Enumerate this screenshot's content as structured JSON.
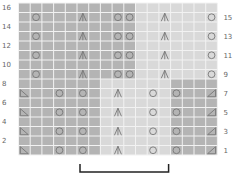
{
  "chart_data": {
    "type": "knitting-chart",
    "columns": 17,
    "rows": 16,
    "left_row_labels": [
      "2",
      "4",
      "6",
      "8",
      "10",
      "12",
      "14",
      "16"
    ],
    "right_row_labels": [
      "1",
      "3",
      "5",
      "7",
      "9",
      "11",
      "13",
      "15"
    ],
    "shading": {
      "dark": "#b4b4b4",
      "light": "#d9d9d9",
      "grid_line": "#f2f2f2"
    },
    "regions": [
      {
        "rows": [
          9,
          16
        ],
        "cols": [
          1,
          10
        ],
        "shade": "dark"
      },
      {
        "rows": [
          9,
          16
        ],
        "cols": [
          11,
          17
        ],
        "shade": "light"
      },
      {
        "rows": [
          1,
          8
        ],
        "cols": [
          1,
          7
        ],
        "shade": "dark"
      },
      {
        "rows": [
          1,
          8
        ],
        "cols": [
          8,
          13
        ],
        "shade": "light"
      },
      {
        "rows": [
          1,
          8
        ],
        "cols": [
          14,
          17
        ],
        "shade": "dark"
      }
    ],
    "symbols": [
      {
        "rows": [
          9,
          11,
          13,
          15
        ],
        "col": 2,
        "symbol": "yo"
      },
      {
        "rows": [
          9,
          11,
          13,
          15
        ],
        "col": 6,
        "symbol": "cdd"
      },
      {
        "rows": [
          9,
          11,
          13,
          15
        ],
        "col": 9,
        "symbol": "yo"
      },
      {
        "rows": [
          9,
          11,
          13,
          15
        ],
        "col": 10,
        "symbol": "yo"
      },
      {
        "rows": [
          9,
          11,
          13,
          15
        ],
        "col": 13,
        "symbol": "cdd"
      },
      {
        "rows": [
          9,
          11,
          13,
          15
        ],
        "col": 17,
        "symbol": "yo"
      },
      {
        "rows": [
          1,
          3,
          5,
          7
        ],
        "col": 1,
        "symbol": "ssk"
      },
      {
        "rows": [
          1,
          3,
          5,
          7
        ],
        "col": 4,
        "symbol": "yo"
      },
      {
        "rows": [
          1,
          3,
          5,
          7
        ],
        "col": 6,
        "symbol": "yo"
      },
      {
        "rows": [
          1,
          3,
          5,
          7
        ],
        "col": 9,
        "symbol": "cdd"
      },
      {
        "rows": [
          1,
          3,
          5,
          7
        ],
        "col": 12,
        "symbol": "yo"
      },
      {
        "rows": [
          1,
          3,
          5,
          7
        ],
        "col": 14,
        "symbol": "yo"
      },
      {
        "rows": [
          1,
          3,
          5,
          7
        ],
        "col": 17,
        "symbol": "k2tog"
      }
    ],
    "repeat_bracket": {
      "from_col": 6,
      "to_col": 13
    }
  }
}
